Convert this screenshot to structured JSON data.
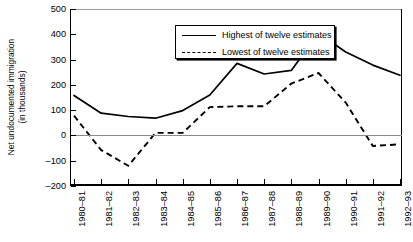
{
  "chart_data": {
    "type": "line",
    "title": "",
    "xlabel": "",
    "ylabel": "Net undocumented immigration (in thousands)",
    "ylabel_lines": [
      "Net undocumented immigration",
      "(in thousands)"
    ],
    "ylim": [
      -200,
      500
    ],
    "yticks": [
      500,
      400,
      300,
      200,
      100,
      0,
      -100,
      -200
    ],
    "ytick_labels": [
      "500",
      "400",
      "300",
      "200",
      "100",
      "0",
      "–100",
      "–200"
    ],
    "grid": false,
    "zero_line": true,
    "legend_position": "top-left-inside",
    "categories": [
      "1980–81",
      "1981–82",
      "1982–83",
      "1983–84",
      "1984–85",
      "1985–86",
      "1986–87",
      "1987–88",
      "1988–89",
      "1989–90",
      "1990–91",
      "1991–92",
      "1992–93"
    ],
    "series": [
      {
        "name": "Highest of twelve estimates",
        "style": "solid",
        "color": "#000000",
        "values": [
          158,
          88,
          75,
          68,
          98,
          160,
          285,
          243,
          257,
          405,
          330,
          278,
          238
        ]
      },
      {
        "name": "Lowest of twelve estimates",
        "style": "dashed",
        "color": "#000000",
        "values": [
          78,
          -58,
          -120,
          10,
          10,
          112,
          115,
          115,
          205,
          247,
          130,
          -42,
          -35
        ]
      }
    ]
  },
  "legend": {
    "items": [
      {
        "label": "Highest of twelve estimates",
        "style": "solid"
      },
      {
        "label": "Lowest of twelve estimates",
        "style": "dashed"
      }
    ]
  }
}
